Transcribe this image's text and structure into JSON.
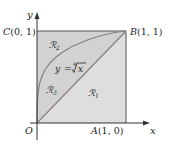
{
  "diagram": {
    "axes": {
      "x_label": "x",
      "y_label": "y",
      "origin_label": "O"
    },
    "points": {
      "A": {
        "name": "A",
        "coords": "(1, 0)"
      },
      "B": {
        "name": "B",
        "coords": "(1, 1)"
      },
      "C": {
        "name": "C",
        "coords": "(0, 1)"
      }
    },
    "curve": {
      "equation_lhs": "y =",
      "root_index": "4",
      "radicand": "x"
    },
    "regions": {
      "R1": {
        "symbol": "ℛ",
        "sub": "1"
      },
      "R2": {
        "symbol": "ℛ",
        "sub": "2"
      },
      "R3": {
        "symbol": "ℛ",
        "sub": "3"
      }
    },
    "colors": {
      "square_fill": "#dedede",
      "upper_fill": "#d2d2d2",
      "line": "#8a807b",
      "axis": "#333333",
      "border": "#555555"
    }
  }
}
